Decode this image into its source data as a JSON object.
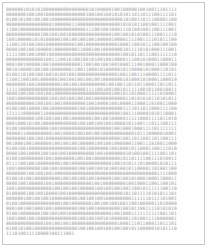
{
  "document": {
    "kind": "binary-digit-page",
    "description": "A printed page densely filled with rows of binary digits",
    "border_color": "#c8c8c8",
    "page_background": "#fefefe",
    "text_color": "#9a9a9a",
    "columns_per_row": 60,
    "row_count": 46,
    "last_row_partial": true,
    "last_row_length": 24,
    "rows": [
      "000000101010100000000000000001010000010010",
      "000000010010010000000000000010010010010101",
      "010010100100100100000000000000000000000001",
      "000000000000000010000001100000000000000010",
      "110010000000000000000000000011100100100011",
      "000000000000100100100100000000000000010010",
      "100100000101010000010010010010010000010000",
      "110011010010010000000000100100000000000100",
      "000010010010000010000000011000100100000001",
      "111110010010001000000000000000000000000010",
      "000000000000010011100101001001010010010000",
      "000100100000100100000000001100100100100100",
      "001010000100100100000001100110001010000010",
      "010011010010010010100100100000000000000100",
      "110011001001000000100100100100100100000001",
      "000000010010000000010010010000000001001001",
      "111110000000000000000000000011110010010010",
      "000010010010010010000000000000000000010010",
      "100100000000000100100100100100100000000000",
      "000000000010010010010000000010010000100100",
      "010010010000100100000000010010000000000001",
      "121111000000110000000000000000000000000010",
      "000000000010010010010010000000100100100000",
      "000100010100100000000000010010010010010000",
      "010010000000000100100000000000000000010010",
      "000001100000000010010000100100100100000000",
      "000000010010010000000000000000000000000010",
      "001000100100000010010010010000010010010000",
      "010010010000000000000000010010000000100100",
      "000010010000100100100100000000010010000000",
      "010010000000010010000000100100100000000010",
      "011110010010000000010010000000000000010010",
      "100100000000100100100000010010010010100100",
      "000000010010010010000000000000000000000000",
      "010010100100000000010010010010010000010010",
      "000010010000010010000000000000100100000000",
      "100100000000000010010010010000010010010010",
      "010000010010010000100100000000000000000001",
      "000000100100100100000000010010010010000000",
      "010010000000000000010010000000100100100100",
      "000100100100010010000000010010010000000010",
      "010010000000100100100100000000000000010010",
      "100100010010000000000000010010010010100000",
      "000000000000010010010010000000000000000100",
      "010010100100000000000000010010010010010010",
      "111010011110000"
    ]
  }
}
